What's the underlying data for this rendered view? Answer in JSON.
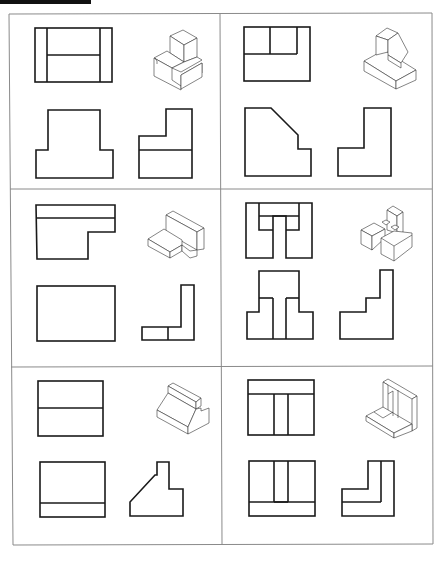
{
  "worksheet": {
    "type": "orthographic-projection-exercise",
    "layout": {
      "rows": 3,
      "columns": 2
    },
    "colors": {
      "line": "#1a1a1a",
      "frame": "#8a8a8a",
      "background": "#ffffff",
      "header_bar": "#111111"
    },
    "panels": [
      {
        "id": "panel-1",
        "row": 1,
        "col": 1,
        "views": [
          "top-view",
          "isometric",
          "front-view",
          "side-view"
        ],
        "description": "Stepped block with raised rear block and notch"
      },
      {
        "id": "panel-2",
        "row": 1,
        "col": 2,
        "views": [
          "top-view",
          "isometric",
          "front-view",
          "side-view"
        ],
        "description": "Base block with angled-face upper block"
      },
      {
        "id": "panel-3",
        "row": 2,
        "col": 1,
        "views": [
          "top-view",
          "isometric",
          "front-view",
          "side-view"
        ],
        "description": "L-bracket with notched base"
      },
      {
        "id": "panel-4",
        "row": 2,
        "col": 2,
        "views": [
          "top-view",
          "isometric",
          "front-view",
          "side-view"
        ],
        "description": "Multi-block assembly with central slot"
      },
      {
        "id": "panel-5",
        "row": 3,
        "col": 1,
        "views": [
          "top-view",
          "isometric",
          "front-view",
          "side-view"
        ],
        "description": "Block with sloped face and rear step"
      },
      {
        "id": "panel-6",
        "row": 3,
        "col": 2,
        "views": [
          "top-view",
          "isometric",
          "front-view",
          "side-view"
        ],
        "description": "Corner bracket with stepped slot"
      }
    ]
  }
}
